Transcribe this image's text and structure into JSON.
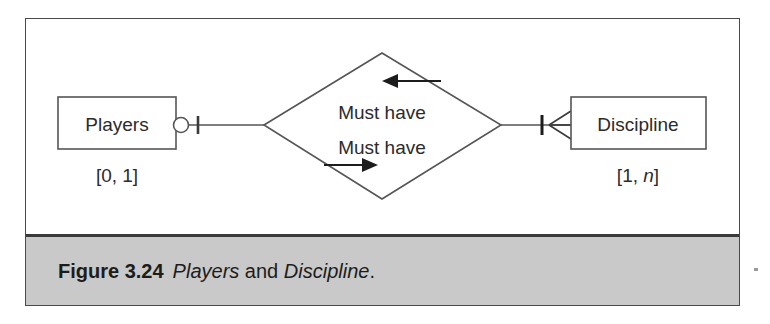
{
  "figure": {
    "caption_number": "Figure 3.24",
    "caption_title_part1": "Players",
    "caption_title_joiner": " and ",
    "caption_title_part2": "Discipline",
    "caption_title_end": "."
  },
  "diagram": {
    "type": "entity-relationship",
    "notation": "crow's foot",
    "entities": [
      {
        "id": "players",
        "label": "Players",
        "cardinality": "[0, 1]",
        "cardinality_min": "0",
        "cardinality_max": "1",
        "connector": "optional-one",
        "position": "left"
      },
      {
        "id": "discipline",
        "label": "Discipline",
        "cardinality_open": "[1, ",
        "cardinality_italic": "n",
        "cardinality_close": "]",
        "cardinality": "[1, n]",
        "cardinality_min": "1",
        "cardinality_max": "n",
        "connector": "one-to-many",
        "position": "right"
      }
    ],
    "relationship": {
      "id": "must-have",
      "label_top": "Must have",
      "label_bottom": "Must have",
      "arrow_top_direction": "left",
      "arrow_bottom_direction": "right",
      "shape": "diamond"
    },
    "colors": {
      "line": "#3a3a3a",
      "text": "#2b2b2b",
      "background": "#ffffff",
      "caption_background": "#c9c9c9"
    }
  }
}
